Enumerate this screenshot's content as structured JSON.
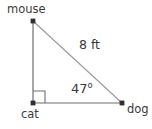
{
  "figure": {
    "type": "right-triangle-geometry-diagram",
    "background_color": "#ffffff",
    "stroke_color": "#6e6e6e",
    "text_color": "#3a3a3a",
    "vertices": [
      {
        "name": "mouse",
        "label": "mouse",
        "x": 33,
        "y": 21
      },
      {
        "name": "cat",
        "label": "cat",
        "x": 33,
        "y": 103
      },
      {
        "name": "dog",
        "label": "dog",
        "x": 122,
        "y": 103
      }
    ],
    "labels": {
      "mouse": "mouse",
      "cat": "cat",
      "dog": "dog",
      "hypotenuse": "8 ft",
      "angle_value": "47",
      "angle_degree_symbol": "o"
    },
    "markers": {
      "right_angle_at": "cat",
      "right_angle_size": 12
    },
    "measurements": {
      "hypotenuse_length": "8 ft",
      "angle_at_dog": "47°",
      "angle_at_cat": "90°"
    }
  }
}
